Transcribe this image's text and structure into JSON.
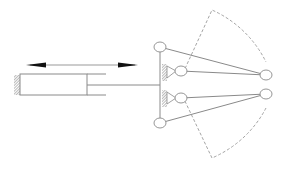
{
  "diagram": {
    "title": "",
    "type": "mechanism-schematic",
    "colors": {
      "line": "#8a8a8a",
      "arrow": "#111111",
      "hatch": "#777777",
      "dashed": "#9a9a9a",
      "background": "#ffffff"
    },
    "components": [
      {
        "id": "motion-arrow",
        "label": ""
      },
      {
        "id": "hydraulic-cylinder",
        "label": ""
      },
      {
        "id": "piston-rod",
        "label": ""
      },
      {
        "id": "link-bar",
        "label": ""
      },
      {
        "id": "upper-arm",
        "label": ""
      },
      {
        "id": "lower-arm",
        "label": ""
      },
      {
        "id": "swing-arc",
        "label": ""
      }
    ]
  }
}
